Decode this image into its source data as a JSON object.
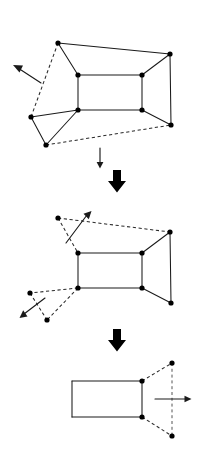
{
  "figure": {
    "background_color": "#ffffff",
    "line_color": "#1a1a1a",
    "vertex_color": "#000000",
    "width": 202,
    "height": 450
  },
  "stages": [
    {
      "id": "stage-1",
      "label": "Initial folded polyhedron",
      "vertices": [
        {
          "name": "top-left-apex",
          "x": 58,
          "y": 43
        },
        {
          "name": "top-right-apex",
          "x": 170,
          "y": 54
        },
        {
          "name": "inner-top-left",
          "x": 78,
          "y": 75
        },
        {
          "name": "inner-top-right",
          "x": 142,
          "y": 75
        },
        {
          "name": "inner-bottom-left",
          "x": 78,
          "y": 110
        },
        {
          "name": "inner-bottom-right",
          "x": 142,
          "y": 110
        },
        {
          "name": "left-apex",
          "x": 31,
          "y": 117
        },
        {
          "name": "bottom-left-apex",
          "x": 46,
          "y": 145
        },
        {
          "name": "bottom-right-apex",
          "x": 171,
          "y": 125
        }
      ],
      "solid_edges": [
        [
          "top-left-apex",
          "top-right-apex"
        ],
        [
          "top-left-apex",
          "inner-top-left"
        ],
        [
          "top-right-apex",
          "inner-top-right"
        ],
        [
          "top-right-apex",
          "bottom-right-apex"
        ],
        [
          "inner-top-left",
          "inner-top-right"
        ],
        [
          "inner-top-left",
          "inner-bottom-left"
        ],
        [
          "inner-top-right",
          "inner-bottom-right"
        ],
        [
          "inner-bottom-left",
          "inner-bottom-right"
        ],
        [
          "inner-bottom-left",
          "left-apex"
        ],
        [
          "inner-bottom-left",
          "bottom-left-apex"
        ],
        [
          "inner-bottom-right",
          "bottom-right-apex"
        ],
        [
          "left-apex",
          "bottom-left-apex"
        ]
      ],
      "dashed_edges": [
        [
          "top-left-apex",
          "left-apex"
        ],
        [
          "bottom-left-apex",
          "bottom-right-apex"
        ]
      ],
      "arrow": {
        "name": "motion-arrow-up-left",
        "direction": "up-left",
        "from_x": 41,
        "from_y": 83,
        "to_x": 14,
        "to_y": 66
      }
    },
    {
      "id": "stage-2",
      "label": "Partially unfolded polyhedron",
      "vertices": [
        {
          "name": "top-left-apex",
          "x": 58,
          "y": 218
        },
        {
          "name": "top-right-apex",
          "x": 170,
          "y": 232
        },
        {
          "name": "inner-top-left",
          "x": 78,
          "y": 253
        },
        {
          "name": "inner-top-right",
          "x": 142,
          "y": 253
        },
        {
          "name": "inner-bottom-left",
          "x": 78,
          "y": 288
        },
        {
          "name": "inner-bottom-right",
          "x": 142,
          "y": 288
        },
        {
          "name": "left-apex",
          "x": 30,
          "y": 293
        },
        {
          "name": "bottom-left-apex",
          "x": 47,
          "y": 320
        },
        {
          "name": "bottom-right-apex",
          "x": 171,
          "y": 303
        }
      ],
      "solid_edges": [
        [
          "inner-top-left",
          "inner-top-right"
        ],
        [
          "inner-top-left",
          "inner-bottom-left"
        ],
        [
          "inner-top-right",
          "inner-bottom-right"
        ],
        [
          "inner-bottom-left",
          "inner-bottom-right"
        ],
        [
          "inner-top-right",
          "top-right-apex"
        ],
        [
          "top-right-apex",
          "bottom-right-apex"
        ],
        [
          "inner-bottom-right",
          "bottom-right-apex"
        ]
      ],
      "dashed_edges": [
        [
          "top-left-apex",
          "top-right-apex"
        ],
        [
          "top-left-apex",
          "inner-top-left"
        ],
        [
          "inner-bottom-left",
          "left-apex"
        ],
        [
          "inner-bottom-left",
          "bottom-left-apex"
        ],
        [
          "left-apex",
          "bottom-left-apex"
        ]
      ],
      "arrows": [
        {
          "name": "motion-arrow-up-right",
          "direction": "up-right",
          "from_x": 66,
          "from_y": 243,
          "to_x": 90,
          "to_y": 212
        },
        {
          "name": "motion-arrow-down-left",
          "direction": "down-left",
          "from_x": 45,
          "from_y": 298,
          "to_x": 21,
          "to_y": 317
        }
      ]
    },
    {
      "id": "stage-3",
      "label": "Fully unfolded rectangle with detached flap",
      "vertices": [
        {
          "name": "rect-top-left",
          "x": 72,
          "y": 381
        },
        {
          "name": "rect-top-right",
          "x": 142,
          "y": 381
        },
        {
          "name": "rect-bottom-left",
          "x": 72,
          "y": 417
        },
        {
          "name": "rect-bottom-right",
          "x": 142,
          "y": 417
        },
        {
          "name": "flap-top-apex",
          "x": 172,
          "y": 363
        },
        {
          "name": "flap-bottom-apex",
          "x": 172,
          "y": 436
        }
      ],
      "solid_edges": [
        [
          "rect-top-left",
          "rect-top-right"
        ],
        [
          "rect-top-left",
          "rect-bottom-left"
        ],
        [
          "rect-top-right",
          "rect-bottom-right"
        ],
        [
          "rect-bottom-left",
          "rect-bottom-right"
        ]
      ],
      "dashed_edges": [
        [
          "rect-top-right",
          "flap-top-apex"
        ],
        [
          "rect-bottom-right",
          "flap-bottom-apex"
        ],
        [
          "flap-top-apex",
          "flap-bottom-apex"
        ]
      ],
      "arrow": {
        "name": "motion-arrow-right",
        "direction": "right",
        "from_x": 155,
        "from_y": 399,
        "to_x": 191,
        "to_y": 399
      }
    }
  ],
  "transitions": [
    {
      "name": "transition-arrow-thin",
      "style": "thin",
      "direction": "down",
      "x": 100,
      "y_start": 148,
      "y_end": 167
    },
    {
      "name": "transition-arrow-bold-1",
      "style": "bold",
      "direction": "down",
      "x": 117,
      "y_start": 170,
      "y_end": 192
    },
    {
      "name": "transition-arrow-bold-2",
      "style": "bold",
      "direction": "down",
      "x": 117,
      "y_start": 329,
      "y_end": 351
    }
  ]
}
